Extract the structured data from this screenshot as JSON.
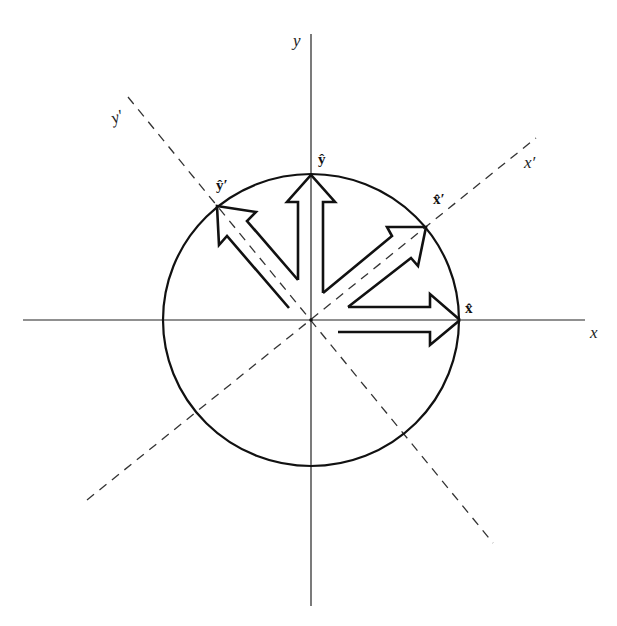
{
  "diagram": {
    "axes": {
      "x_label": "x",
      "y_label": "y",
      "x_prime_label": "x′",
      "y_prime_label": "y′"
    },
    "unit_vectors": {
      "x_hat": "x̂",
      "y_hat": "ŷ",
      "x_hat_prime": "x̂′",
      "y_hat_prime": "ŷ′"
    },
    "colors": {
      "line": "#111111",
      "dashed": "#333333",
      "background": "#ffffff"
    }
  }
}
